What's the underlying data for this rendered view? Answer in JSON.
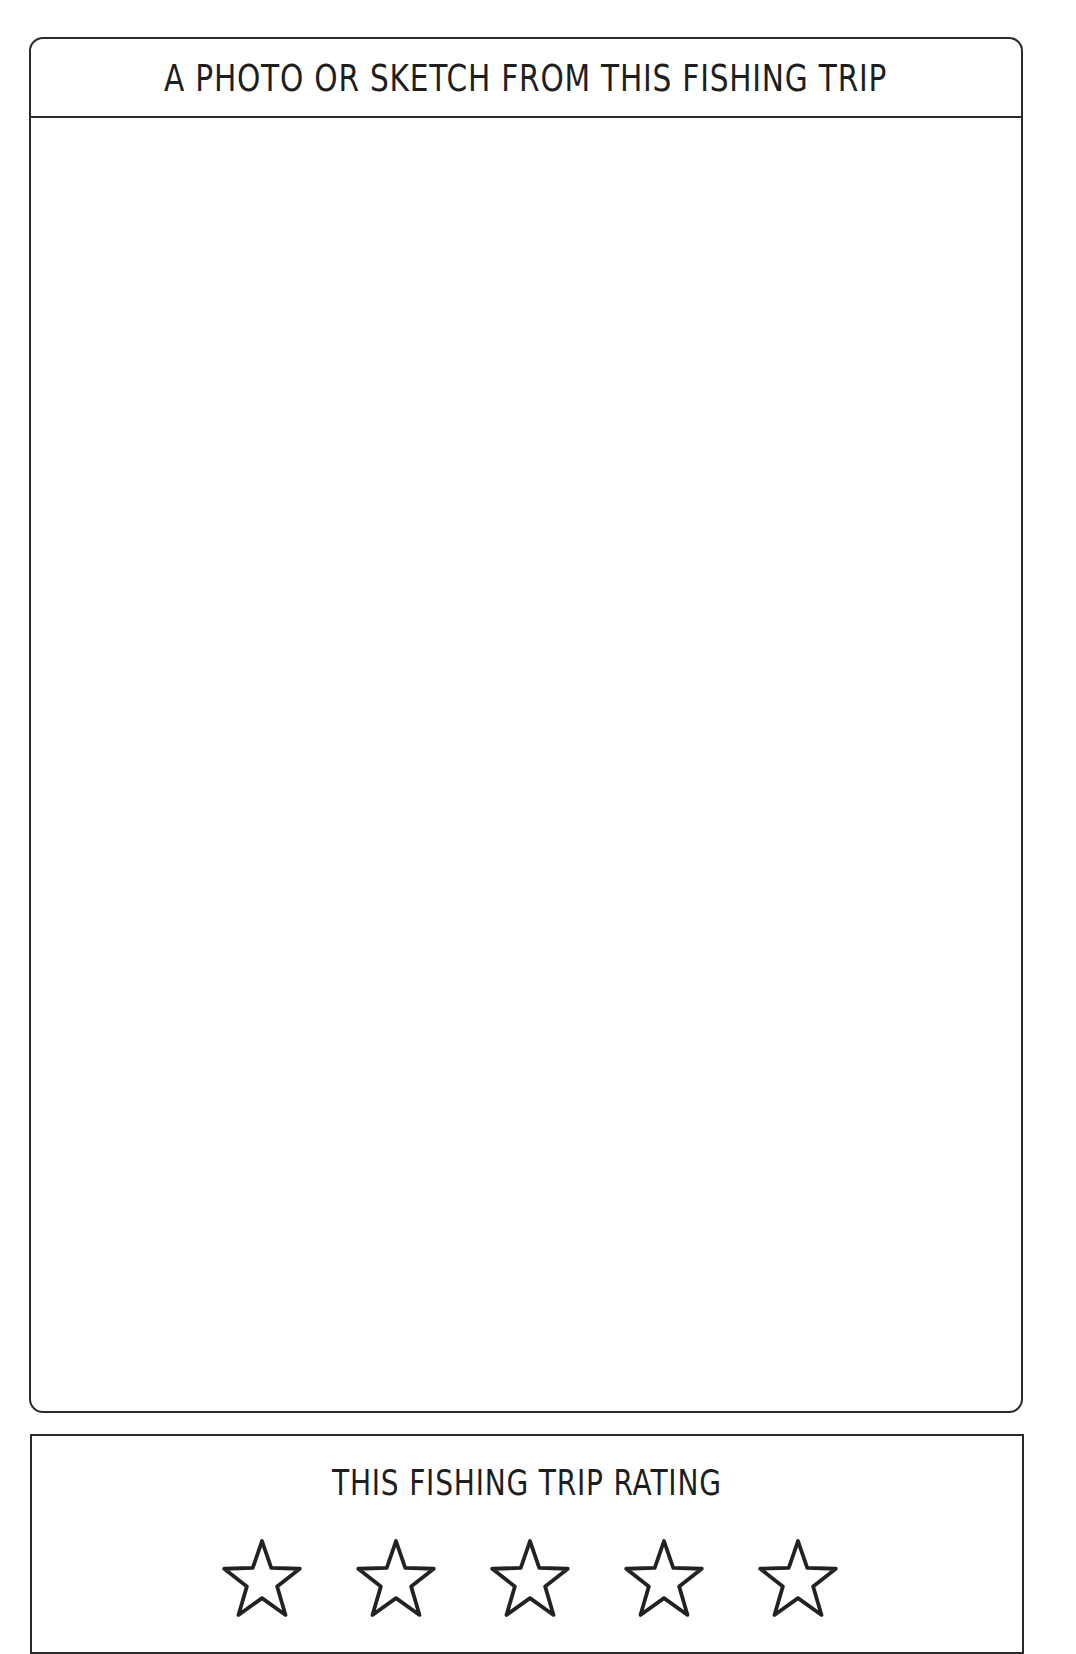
{
  "photo_section": {
    "title": "A PHOTO OR SKETCH FROM THIS FISHING TRIP",
    "content": ""
  },
  "rating_section": {
    "title": "THIS FISHING TRIP RATING",
    "max_stars": 5,
    "filled_stars": 0,
    "stars": [
      {
        "icon": "star-outline-icon",
        "filled": false
      },
      {
        "icon": "star-outline-icon",
        "filled": false
      },
      {
        "icon": "star-outline-icon",
        "filled": false
      },
      {
        "icon": "star-outline-icon",
        "filled": false
      },
      {
        "icon": "star-outline-icon",
        "filled": false
      }
    ]
  },
  "colors": {
    "ink": "#2a2a2a",
    "background": "#ffffff"
  }
}
